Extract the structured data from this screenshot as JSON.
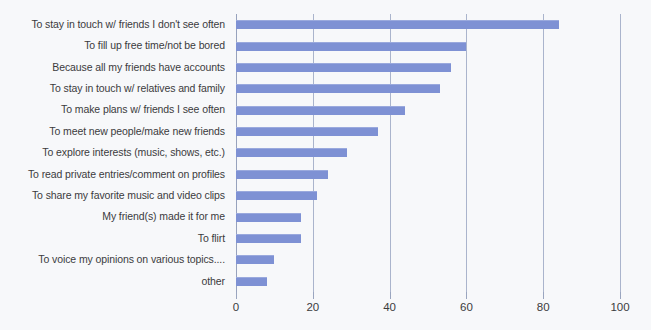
{
  "chart_data": {
    "type": "bar",
    "orientation": "horizontal",
    "title": "",
    "xlabel": "",
    "ylabel": "",
    "xlim": [
      0,
      100
    ],
    "xticks": [
      0,
      20,
      40,
      60,
      80,
      100
    ],
    "xtick_labels": [
      "0",
      "20",
      "40",
      "60",
      "80",
      "100"
    ],
    "grid": true,
    "legend": false,
    "bar_color": "#7e91d4",
    "gridline_color": "#aab4cc",
    "text_color": "#3b3b3d",
    "background_color": "#f7f8fa",
    "categories": [
      "To stay in touch w/ friends I don't see often",
      "To fill up free time/not be bored",
      "Because all my friends have accounts",
      "To stay in touch w/ relatives and family",
      "To make plans w/ friends I see often",
      "To meet new people/make new friends",
      "To explore interests (music, shows, etc.)",
      "To read private entries/comment on profiles",
      "To share my favorite music and video clips",
      "My friend(s) made it for me",
      "To flirt",
      "To voice my opinions on various topics....",
      "other"
    ],
    "values": [
      84,
      60,
      56,
      53,
      44,
      37,
      29,
      24,
      21,
      17,
      17,
      10,
      8
    ]
  }
}
